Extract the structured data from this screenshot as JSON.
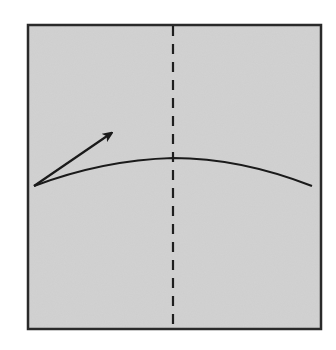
{
  "diagram": {
    "type": "origami-fold-step",
    "paper": {
      "x": 28,
      "y": 25,
      "width": 293,
      "height": 304,
      "fill": "#d2d2d2",
      "stroke": "#2a2a2a"
    },
    "center_crease": {
      "style": "dashed",
      "x": 173,
      "y1": 25,
      "y2": 329
    },
    "fold_curve": {
      "from": [
        34,
        186
      ],
      "peak": [
        173,
        158
      ],
      "to": [
        312,
        186
      ]
    },
    "arrow": {
      "from": [
        34,
        186
      ],
      "to": [
        113,
        132
      ],
      "direction": "up-right"
    }
  }
}
